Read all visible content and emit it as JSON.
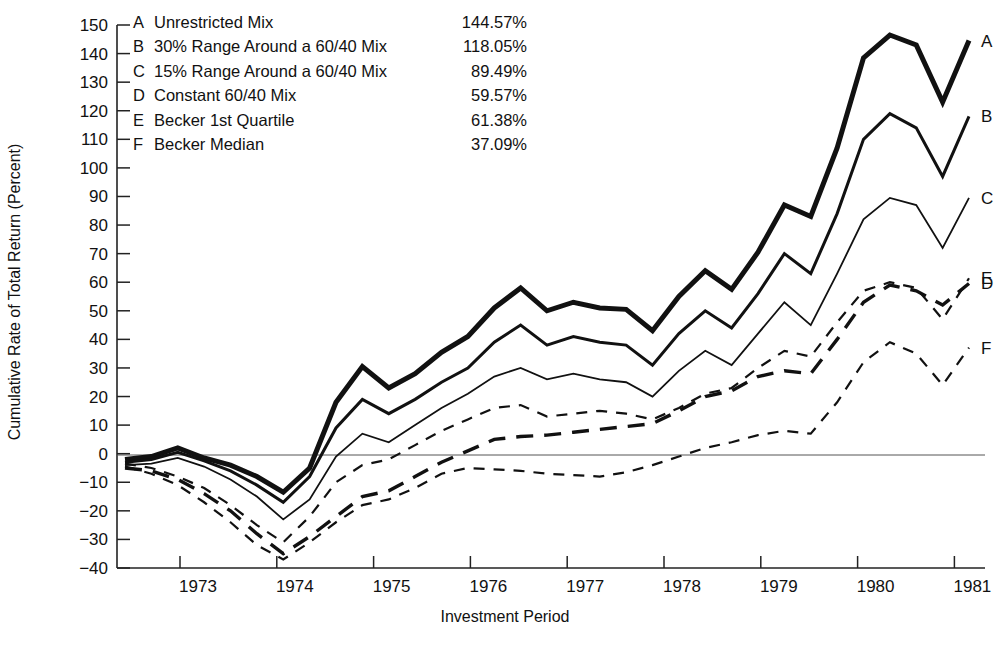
{
  "chart_data": {
    "type": "line",
    "title": "",
    "xlabel": "Investment Period",
    "ylabel": "Cumulative Rate of Total Return (Percent)",
    "ylim": [
      -40,
      150
    ],
    "ytick_step": 10,
    "yticks": [
      -40,
      -30,
      -20,
      -10,
      0,
      10,
      20,
      30,
      40,
      50,
      60,
      70,
      80,
      90,
      100,
      110,
      120,
      130,
      140,
      150
    ],
    "xticks": [
      "1973",
      "1974",
      "1975",
      "1976",
      "1977",
      "1978",
      "1979",
      "1980",
      "1981"
    ],
    "x_note": "Quarterly observations; year labels centered between tick marks",
    "grid": false,
    "zero_line": true,
    "legend_position": "top-left-inside",
    "series": [
      {
        "key": "A",
        "name": "Unrestricted Mix",
        "final_value_label": "144.57%",
        "final_value": 144.57,
        "style": "solid",
        "width": 5,
        "values": [
          -2.0,
          -1.0,
          2.0,
          -1.5,
          -4.0,
          -8.0,
          -13.5,
          -5.0,
          18.0,
          30.5,
          23.0,
          28.0,
          35.5,
          41.0,
          51.0,
          58.0,
          50.0,
          53.0,
          51.0,
          50.5,
          43.0,
          55.0,
          64.0,
          57.5,
          70.5,
          87.0,
          83.0,
          107.0,
          138.5,
          146.5,
          143.0,
          123.0,
          144.57
        ]
      },
      {
        "key": "B",
        "name": "30% Range Around a 60/40 Mix",
        "final_value_label": "118.05%",
        "final_value": 118.05,
        "style": "solid",
        "width": 3,
        "values": [
          -3.0,
          -2.0,
          0.5,
          -2.5,
          -6.0,
          -11.0,
          -17.0,
          -8.0,
          9.0,
          19.0,
          14.0,
          19.0,
          25.0,
          30.0,
          39.0,
          45.0,
          38.0,
          41.0,
          39.0,
          38.0,
          31.0,
          42.0,
          50.0,
          44.0,
          56.0,
          70.0,
          63.0,
          84.0,
          110.0,
          119.0,
          114.0,
          97.0,
          118.05
        ]
      },
      {
        "key": "C",
        "name": "15% Range Around a 60/40 Mix",
        "final_value_label": "89.49%",
        "final_value": 89.49,
        "style": "solid",
        "width": 1.8,
        "values": [
          -4.0,
          -3.5,
          -1.5,
          -4.5,
          -9.0,
          -15.0,
          -23.0,
          -16.0,
          -1.0,
          7.0,
          4.0,
          10.0,
          16.0,
          21.0,
          27.0,
          30.0,
          26.0,
          28.0,
          26.0,
          25.0,
          20.0,
          29.0,
          36.0,
          31.0,
          42.0,
          53.0,
          45.0,
          63.0,
          82.0,
          89.5,
          87.0,
          72.0,
          89.49
        ]
      },
      {
        "key": "D",
        "name": "Constant 60/40 Mix",
        "final_value_label": "59.57%",
        "final_value": 59.57,
        "style": "dashed-long",
        "width": 3.4,
        "values": [
          -5.0,
          -6.0,
          -9.0,
          -14.0,
          -20.0,
          -28.0,
          -35.0,
          -29.0,
          -22.0,
          -15.0,
          -13.0,
          -8.0,
          -3.0,
          1.0,
          5.0,
          6.0,
          6.5,
          7.5,
          8.5,
          9.5,
          10.5,
          15.0,
          20.0,
          22.0,
          27.0,
          29.0,
          28.0,
          40.0,
          53.0,
          59.0,
          57.0,
          52.0,
          59.57
        ]
      },
      {
        "key": "E",
        "name": "Becker 1st Quartile",
        "final_value_label": "61.38%",
        "final_value": 61.38,
        "style": "dashed-short",
        "width": 2.2,
        "values": [
          -3.5,
          -5.0,
          -8.0,
          -12.0,
          -18.0,
          -25.0,
          -31.0,
          -22.0,
          -10.0,
          -4.0,
          -2.0,
          3.0,
          8.0,
          12.0,
          16.0,
          17.0,
          13.0,
          14.0,
          15.0,
          14.0,
          12.0,
          16.0,
          21.0,
          23.0,
          30.0,
          36.0,
          34.0,
          46.0,
          57.0,
          60.0,
          58.0,
          47.0,
          61.38
        ]
      },
      {
        "key": "F",
        "name": "Becker Median",
        "final_value_label": "37.09%",
        "final_value": 37.09,
        "style": "dashed-short",
        "width": 2.2,
        "values": [
          -4.5,
          -7.0,
          -11.0,
          -17.0,
          -24.0,
          -32.0,
          -37.0,
          -31.0,
          -24.0,
          -18.0,
          -16.0,
          -12.0,
          -7.0,
          -5.0,
          -5.5,
          -6.0,
          -7.0,
          -7.5,
          -8.0,
          -6.5,
          -4.0,
          -1.0,
          2.0,
          4.0,
          6.5,
          8.0,
          7.0,
          18.0,
          32.0,
          39.0,
          35.0,
          24.0,
          37.09
        ]
      }
    ]
  },
  "legend": {
    "rows": [
      {
        "key": "A",
        "label": "Unrestricted Mix",
        "value": "144.57%"
      },
      {
        "key": "B",
        "label": "30% Range Around a 60/40 Mix",
        "value": "118.05%"
      },
      {
        "key": "C",
        "label": "15% Range Around a 60/40 Mix",
        "value": "89.49%"
      },
      {
        "key": "D",
        "label": "Constant 60/40 Mix",
        "value": "59.57%"
      },
      {
        "key": "E",
        "label": "Becker 1st Quartile",
        "value": "61.38%"
      },
      {
        "key": "F",
        "label": "Becker Median",
        "value": "37.09%"
      }
    ]
  },
  "axes": {
    "y_title": "Cumulative Rate of Total Return (Percent)",
    "x_title": "Investment Period"
  },
  "end_labels": [
    {
      "key": "A"
    },
    {
      "key": "B"
    },
    {
      "key": "C"
    },
    {
      "key": "E"
    },
    {
      "key": "D"
    },
    {
      "key": "F"
    }
  ],
  "colors": {
    "ink": "#111111",
    "axis": "#222222",
    "zero_line": "#555555",
    "background": "#ffffff"
  }
}
